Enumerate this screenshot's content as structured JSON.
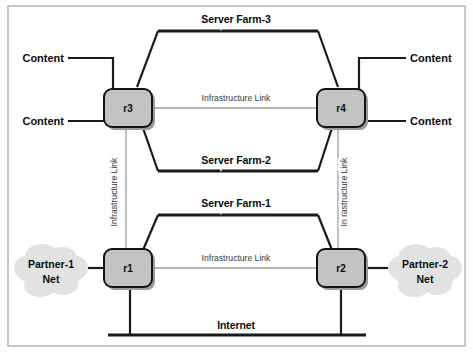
{
  "figure": {
    "type": "network-topology-diagram",
    "background_color": "#ffffff",
    "frame_color": "#b9b9b9",
    "line_color": "#1a1a1a",
    "router_fill": "#c3c3c3",
    "cloud_fill": "#e2e2e2"
  },
  "routers": [
    {
      "id": "r3",
      "label": "r3",
      "x": 130,
      "y": 108
    },
    {
      "id": "r4",
      "label": "r4",
      "x": 341,
      "y": 108
    },
    {
      "id": "r1",
      "label": "r1",
      "x": 130,
      "y": 268
    },
    {
      "id": "r2",
      "label": "r2",
      "x": 341,
      "y": 268
    }
  ],
  "segments": [
    {
      "id": "server-farm-3",
      "label": "Server Farm-3",
      "x": 236,
      "y": 20
    },
    {
      "id": "server-farm-2",
      "label": "Server Farm-2",
      "x": 236,
      "y": 160
    },
    {
      "id": "server-farm-1",
      "label": "Server Farm-1",
      "x": 236,
      "y": 204
    },
    {
      "id": "internet",
      "label": "Internet",
      "x": 236,
      "y": 325
    }
  ],
  "links": [
    {
      "id": "infra-link-top",
      "label": "Infrastructure Link",
      "orientation": "horizontal",
      "x": 236,
      "y": 97
    },
    {
      "id": "infra-link-bottom",
      "label": "Infrastructure Link",
      "orientation": "horizontal",
      "x": 236,
      "y": 257
    },
    {
      "id": "infra-link-left",
      "label": "Infrastructure Link",
      "orientation": "vertical",
      "x": 119,
      "y": 190
    },
    {
      "id": "infra-link-right",
      "label": "In rastructure Link",
      "orientation": "vertical",
      "x": 345,
      "y": 190
    }
  ],
  "endpoints": [
    {
      "id": "content-top-left",
      "label": "Content",
      "side": "left",
      "x": 34,
      "y": 58
    },
    {
      "id": "content-bottom-left",
      "label": "Content",
      "side": "left",
      "x": 34,
      "y": 121
    },
    {
      "id": "content-top-right",
      "label": "Content",
      "side": "right",
      "x": 440,
      "y": 58
    },
    {
      "id": "content-bottom-right",
      "label": "Content",
      "side": "right",
      "x": 440,
      "y": 121
    }
  ],
  "clouds": [
    {
      "id": "partner-1-net",
      "line1": "Partner-1",
      "line2": "Net",
      "x": 51,
      "y": 271
    },
    {
      "id": "partner-2-net",
      "line1": "Partner-2",
      "line2": "Net",
      "x": 425,
      "y": 271
    }
  ]
}
